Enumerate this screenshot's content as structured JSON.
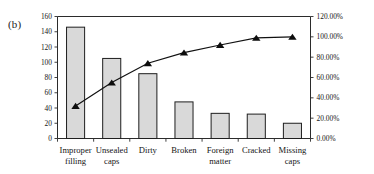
{
  "figure": {
    "panel_label": "(b)",
    "accent_bar_color": "#d9d9d9",
    "accent_line_color": "#111111"
  },
  "chart_data": {
    "type": "bar",
    "title": "",
    "subtitle": "",
    "xlabel": "",
    "ylabel": "",
    "y2label": "",
    "grid": false,
    "legend": "none",
    "categories": [
      "Improper filling",
      "Unsealed caps",
      "Dirty",
      "Broken",
      "Foreign matter",
      "Cracked",
      "Missing caps"
    ],
    "category_lines": [
      [
        "Improper",
        "filling"
      ],
      [
        "Unsealed",
        "caps"
      ],
      [
        "Dirty",
        ""
      ],
      [
        "Broken",
        ""
      ],
      [
        "Foreign",
        "matter"
      ],
      [
        "Cracked",
        ""
      ],
      [
        "Missing",
        "caps"
      ]
    ],
    "values": [
      146,
      105,
      85,
      48,
      33,
      32,
      20
    ],
    "ylim": [
      0,
      160
    ],
    "yticks": [
      0,
      20,
      40,
      60,
      80,
      100,
      120,
      140,
      160
    ],
    "ytick_labels": [
      "0",
      "20",
      "40",
      "60",
      "80",
      "100",
      "120",
      "140",
      "160"
    ],
    "y2lim": [
      0,
      120
    ],
    "y2ticks": [
      0,
      20,
      40,
      60,
      80,
      100,
      120
    ],
    "y2tick_labels": [
      "0.00%",
      "20.00%",
      "40.00%",
      "60.00%",
      "80.00%",
      "100.00%",
      "120.00%"
    ],
    "series": [
      {
        "name": "Defect count",
        "type": "bar",
        "axis": "left",
        "values": [
          146,
          105,
          85,
          48,
          33,
          32,
          20
        ]
      },
      {
        "name": "Cumulative percentage",
        "type": "line",
        "axis": "right",
        "marker": "triangle",
        "values": [
          32.0,
          55.0,
          74.0,
          84.5,
          92.0,
          99.0,
          100.0
        ]
      }
    ]
  }
}
